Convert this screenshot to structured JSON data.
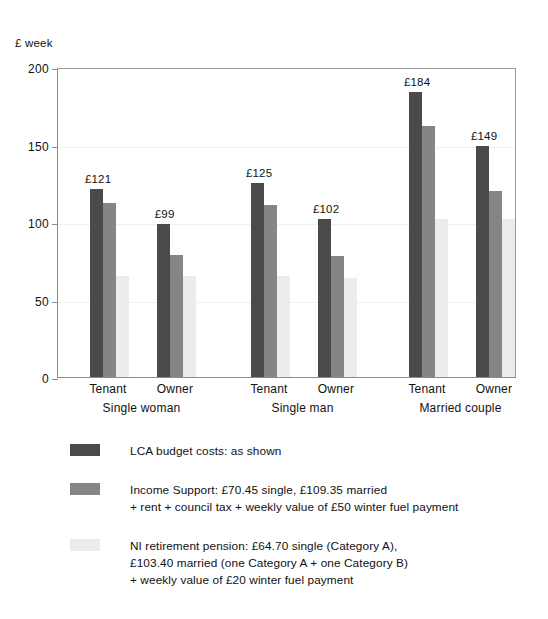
{
  "chart_data": {
    "type": "bar",
    "title": "",
    "subtitle": "",
    "ylabel": "£ week",
    "xlabel": "",
    "ylim": [
      0,
      200
    ],
    "yticks": [
      0,
      50,
      100,
      150,
      200
    ],
    "ytick_labels": [
      "0",
      "50",
      "100",
      "150",
      "200"
    ],
    "grid": true,
    "grid_axis": "y",
    "legend_position": "below",
    "group_labels": [
      "Single woman",
      "Single man",
      "Married couple"
    ],
    "categories": [
      "Single woman / Tenant",
      "Single woman / Owner",
      "Single man / Tenant",
      "Single man / Owner",
      "Married couple / Tenant",
      "Married couple / Owner"
    ],
    "tick_labels": [
      "Tenant",
      "Owner",
      "Tenant",
      "Owner",
      "Tenant",
      "Owner"
    ],
    "series": [
      {
        "name": "LCA budget costs: as shown",
        "color": "#4a4a4a",
        "values": [
          121,
          99,
          125,
          102,
          184,
          149
        ],
        "data_labels": [
          "£121",
          "£99",
          "£125",
          "£102",
          "£184",
          "£149"
        ]
      },
      {
        "name": "Income Support",
        "color": "#858585",
        "values": [
          112,
          79,
          111,
          78,
          162,
          120
        ],
        "data_labels": [
          "",
          "",
          "",
          "",
          "",
          ""
        ]
      },
      {
        "name": "NI retirement pension",
        "color": "#ececec",
        "values": [
          65,
          65,
          65,
          64,
          102,
          102
        ],
        "data_labels": [
          "",
          "",
          "",
          "",
          "",
          ""
        ]
      }
    ],
    "annotations": [
      "£121",
      "£99",
      "£125",
      "£102",
      "£184",
      "£149"
    ]
  },
  "axis": {
    "unit_caption": "£ week"
  },
  "legend": {
    "entries": [
      {
        "color": "#4a4a4a",
        "lines": [
          "LCA budget costs: as shown"
        ]
      },
      {
        "color": "#858585",
        "lines": [
          "Income Support: £70.45 single, £109.35 married",
          "+ rent + council tax + weekly value of £50 winter fuel payment"
        ]
      },
      {
        "color": "#ececec",
        "lines": [
          "NI retirement pension: £64.70 single (Category A),",
          "£103.40 married (one Category A + one Category B)",
          "+ weekly value of £20 winter fuel payment"
        ]
      }
    ]
  }
}
